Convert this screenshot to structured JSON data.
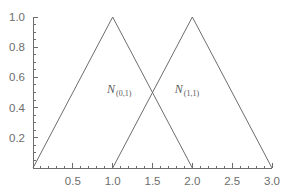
{
  "chart_data": {
    "type": "line",
    "title": "",
    "subtitle": "",
    "xlabel": "",
    "ylabel": "",
    "xlim": [
      0,
      3.0
    ],
    "ylim": [
      0,
      1.0
    ],
    "grid": false,
    "legend_position": "inline-annotation",
    "x_ticks_major": [
      0.5,
      1.0,
      1.5,
      2.0,
      2.5,
      3.0
    ],
    "x_tick_labels": [
      "0.5",
      "1.0",
      "1.5",
      "2.0",
      "2.5",
      "3.0"
    ],
    "x_minor_tick_step": 0.1,
    "y_ticks_major": [
      0.2,
      0.4,
      0.6,
      0.8,
      1.0
    ],
    "y_tick_labels": [
      "0.2",
      "0.4",
      "0.6",
      "0.8",
      "1.0"
    ],
    "y_minor_tick_step": 0.05,
    "line_color": "#6d6d6d",
    "axis_color": "#6d6d6d",
    "background_color": "#ffffff",
    "series": [
      {
        "name": "N_(0,1)",
        "label_base": "N",
        "label_sub": "(0,1)",
        "label_x": 0.93,
        "label_y": 0.5,
        "x": [
          0.0,
          1.0,
          2.0
        ],
        "values": [
          0.0,
          1.0,
          0.0
        ]
      },
      {
        "name": "N_(1,1)",
        "label_base": "N",
        "label_sub": "(1,1)",
        "label_x": 1.78,
        "label_y": 0.5,
        "x": [
          1.0,
          2.0,
          3.0
        ],
        "values": [
          0.0,
          1.0,
          0.0
        ]
      }
    ],
    "annotations": [
      {
        "text": "N(0,1)",
        "x": 0.93,
        "y": 0.5
      },
      {
        "text": "N(1,1)",
        "x": 1.78,
        "y": 0.5
      }
    ],
    "intersection": {
      "x": 1.5,
      "y": 0.5
    }
  }
}
